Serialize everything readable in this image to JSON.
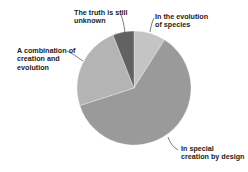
{
  "chart_data": {
    "type": "pie",
    "title": "",
    "start_angle": "12 o'clock",
    "direction": "clockwise",
    "slices": [
      {
        "label": "In the evolution of species",
        "lines": [
          "In the evolution",
          "of species"
        ],
        "value": 9,
        "color": "#c4c4c4"
      },
      {
        "label": "In special creation by design",
        "lines": [
          "In special",
          "creation by design"
        ],
        "value": 61,
        "color": "#9a9a9a"
      },
      {
        "label": "A combination of creation and evolution",
        "lines": [
          "A combination of",
          "creation and",
          "evolution"
        ],
        "value": 24,
        "color": "#b4b4b4"
      },
      {
        "label": "The truth is still unknown",
        "lines": [
          "The truth is still",
          "unknown"
        ],
        "value": 6,
        "color": "#626262"
      }
    ],
    "units": "percent (estimated)",
    "legend": "none (callout labels)"
  }
}
